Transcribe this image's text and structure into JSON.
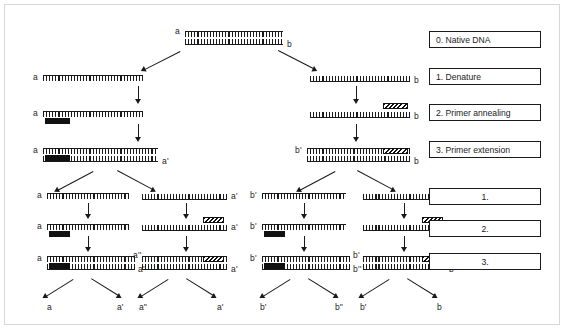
{
  "diagram": {
    "legend": [
      {
        "id": "step-0",
        "label": "0. Native DNA",
        "numbered": false
      },
      {
        "id": "step-1",
        "label": "1. Denature",
        "numbered": false
      },
      {
        "id": "step-2",
        "label": "2. Primer annealing",
        "numbered": false
      },
      {
        "id": "step-3",
        "label": "3. Primer extension",
        "numbered": false
      },
      {
        "id": "step-1b",
        "label": "1.",
        "numbered": true
      },
      {
        "id": "step-2b",
        "label": "2.",
        "numbered": true
      },
      {
        "id": "step-3b",
        "label": "3.",
        "numbered": true
      }
    ],
    "native_dna": {
      "left_label": "a",
      "right_label": "b"
    },
    "cycle1": {
      "denature": {
        "left_strand_label": "a",
        "right_strand_label": "b"
      },
      "annealing": {
        "left_strand_label": "a",
        "right_strand_label": "b",
        "left_primer": "solid-black",
        "right_primer": "hatched"
      },
      "extension": {
        "left_top_label": "a",
        "left_bottom_label": "a'",
        "right_top_label": "b'",
        "right_bottom_label": "b"
      }
    },
    "cycle2": {
      "columns": [
        {
          "denature_label": "a",
          "anneal_label": "a",
          "primer": "solid-black",
          "ext_top_label": "a",
          "ext_bottom_label": "a'",
          "products": [
            "a",
            "a'"
          ]
        },
        {
          "denature_label": "a'",
          "anneal_label": "a'",
          "primer": "hatched",
          "ext_top_label": "a''",
          "ext_bottom_label": "a'",
          "products": [
            "a''",
            "a'"
          ]
        },
        {
          "denature_label": "b'",
          "anneal_label": "b'",
          "primer": "solid-black",
          "ext_top_label": "b'",
          "ext_bottom_label": "b''",
          "products": [
            "b'",
            "b''"
          ]
        },
        {
          "denature_label": "b",
          "anneal_label": "b",
          "primer": "hatched",
          "ext_top_label": "b'",
          "ext_bottom_label": "b",
          "products": [
            "b'",
            "b"
          ]
        }
      ]
    },
    "colors": {
      "ink": "#1a1a1a",
      "frame": "#d8d8d8",
      "background": "#ffffff"
    }
  }
}
